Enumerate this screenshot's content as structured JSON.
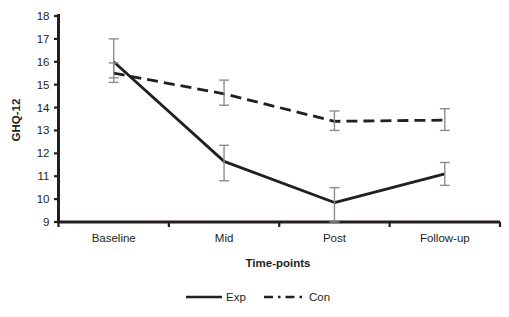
{
  "chart_data": {
    "type": "line",
    "title": "",
    "xlabel": "Time-points",
    "ylabel": "GHQ-12",
    "categories": [
      "Baseline",
      "Mid",
      "Post",
      "Follow-up"
    ],
    "ylim": [
      9,
      18
    ],
    "yticks": [
      9,
      10,
      11,
      12,
      13,
      14,
      15,
      16,
      17,
      18
    ],
    "ytick_labels": [
      "9",
      "10",
      "11",
      "12",
      "13",
      "14",
      "15",
      "16",
      "17",
      "18"
    ],
    "grid": false,
    "legend_position": "bottom",
    "series": [
      {
        "name": "Exp",
        "style": "solid",
        "color": "#231f20",
        "values": [
          16.0,
          11.65,
          9.85,
          11.1
        ],
        "error_low": [
          15.3,
          10.8,
          9.0,
          10.6
        ],
        "error_high": [
          17.0,
          12.35,
          10.5,
          11.6
        ]
      },
      {
        "name": "Con",
        "style": "dashed",
        "color": "#231f20",
        "values": [
          15.5,
          14.6,
          13.4,
          13.45
        ],
        "error_low": [
          15.1,
          14.1,
          13.0,
          13.0
        ],
        "error_high": [
          15.95,
          15.2,
          13.85,
          13.95
        ]
      }
    ]
  },
  "legend": {
    "items": [
      {
        "label": "Exp",
        "style": "solid"
      },
      {
        "label": "Con",
        "style": "dashed"
      }
    ]
  },
  "axis": {
    "y_title": "GHQ-12",
    "x_title": "Time-points"
  }
}
